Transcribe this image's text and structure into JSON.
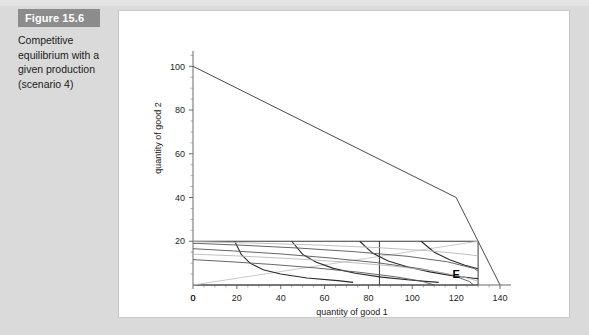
{
  "figure": {
    "banner_label": "Figure 15.6",
    "caption": "Competitive equilibrium with a given production (scenario 4)"
  },
  "colors": {
    "page_background": "#dadada",
    "banner_background": "#8c8c8c",
    "banner_text": "#ffffff",
    "panel_background": "#ffffff",
    "curve_dark": "#2a2a2a",
    "curve_mid": "#555555",
    "curve_light": "#b9b9b9",
    "axis": "#6a6a6a"
  },
  "chart_data": {
    "type": "line",
    "title": "",
    "xlabel": "quantity of good 1",
    "ylabel": "quantity of good 2",
    "xlim": [
      0,
      145
    ],
    "ylim": [
      0,
      107
    ],
    "xticks": [
      0,
      20,
      40,
      60,
      80,
      100,
      120,
      140
    ],
    "yticks": [
      0,
      20,
      40,
      60,
      80,
      100
    ],
    "grid": false,
    "legend": "none",
    "annotations": [
      {
        "text": "E",
        "x": 120,
        "y": 3,
        "bold": true
      }
    ],
    "series": [
      {
        "name": "production possibility frontier",
        "style": "solid-dark",
        "points": [
          [
            0,
            100
          ],
          [
            120,
            40
          ],
          [
            140,
            0
          ]
        ]
      },
      {
        "name": "edgeworth box outline",
        "style": "solid-dark",
        "points": [
          [
            0,
            20
          ],
          [
            130,
            20
          ],
          [
            130,
            0
          ],
          [
            0,
            0
          ]
        ]
      },
      {
        "name": "equilibrium price line",
        "style": "light",
        "points": [
          [
            0,
            0
          ],
          [
            130,
            20
          ]
        ]
      },
      {
        "name": "vertical allocation line",
        "style": "solid-dark",
        "points": [
          [
            85,
            20
          ],
          [
            85,
            0
          ]
        ]
      },
      {
        "name": "consumer A indifference curve 1",
        "style": "dark",
        "points": [
          [
            19,
            20
          ],
          [
            22,
            14
          ],
          [
            26,
            10
          ],
          [
            32,
            7
          ],
          [
            40,
            5
          ],
          [
            52,
            3.2
          ],
          [
            66,
            2
          ],
          [
            73,
            1.2
          ]
        ]
      },
      {
        "name": "consumer A indifference curve 2",
        "style": "dark",
        "points": [
          [
            45,
            20
          ],
          [
            50,
            14
          ],
          [
            56,
            10.5
          ],
          [
            64,
            7.6
          ],
          [
            74,
            5.4
          ],
          [
            86,
            3.6
          ],
          [
            100,
            2.2
          ],
          [
            112,
            1.2
          ]
        ]
      },
      {
        "name": "consumer A indifference curve 3",
        "style": "dark",
        "points": [
          [
            76,
            20
          ],
          [
            82,
            14.5
          ],
          [
            89,
            11
          ],
          [
            98,
            8.2
          ],
          [
            108,
            6
          ],
          [
            118,
            4.3
          ],
          [
            128,
            3.1
          ],
          [
            130,
            2.9
          ]
        ]
      },
      {
        "name": "consumer A indifference curve 4",
        "style": "dark",
        "points": [
          [
            104,
            20
          ],
          [
            110,
            15
          ],
          [
            117,
            11.5
          ],
          [
            124,
            9
          ],
          [
            130,
            7.4
          ]
        ]
      },
      {
        "name": "consumer B indifference curve 1",
        "style": "mid",
        "points": [
          [
            0,
            16.6
          ],
          [
            18,
            15.6
          ],
          [
            40,
            14.2
          ],
          [
            62,
            12.4
          ],
          [
            84,
            10.2
          ],
          [
            104,
            7.4
          ],
          [
            118,
            4.6
          ],
          [
            126,
            1.6
          ],
          [
            128,
            0
          ]
        ]
      },
      {
        "name": "consumer B indifference curve 2",
        "style": "mid",
        "points": [
          [
            0,
            11.6
          ],
          [
            16,
            10.7
          ],
          [
            36,
            9.4
          ],
          [
            56,
            7.8
          ],
          [
            76,
            5.8
          ],
          [
            92,
            3.8
          ],
          [
            104,
            1.8
          ],
          [
            110,
            0
          ]
        ]
      },
      {
        "name": "consumer B indifference curve 3",
        "style": "mid",
        "points": [
          [
            0,
            19.1
          ],
          [
            22,
            18.2
          ],
          [
            48,
            16.9
          ],
          [
            74,
            15.2
          ],
          [
            98,
            13.1
          ],
          [
            116,
            10.6
          ],
          [
            128,
            7.6
          ],
          [
            130,
            6.4
          ]
        ]
      },
      {
        "name": "consumer B indifference curve 4",
        "style": "light",
        "points": [
          [
            0,
            14.1
          ],
          [
            20,
            13.3
          ],
          [
            44,
            12.1
          ],
          [
            68,
            10.6
          ],
          [
            90,
            8.8
          ],
          [
            108,
            6.6
          ],
          [
            122,
            4.0
          ],
          [
            130,
            1.8
          ]
        ]
      },
      {
        "name": "consumer B indifference curve 5",
        "style": "light",
        "points": [
          [
            0,
            19.8
          ],
          [
            26,
            19.2
          ],
          [
            56,
            18.3
          ],
          [
            84,
            17.1
          ],
          [
            108,
            15.6
          ],
          [
            124,
            14.1
          ],
          [
            130,
            13.3
          ]
        ]
      }
    ]
  }
}
